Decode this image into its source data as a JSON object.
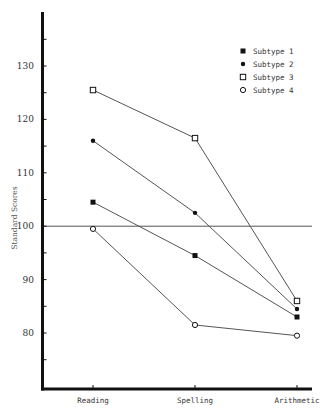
{
  "chart_data": {
    "type": "line",
    "title": "",
    "xlabel": "",
    "ylabel": "Standard Scores",
    "categories": [
      "Reading",
      "Spelling",
      "Arithmetic"
    ],
    "series": [
      {
        "name": "Subtype 1",
        "marker": "filled-square",
        "values": [
          104.5,
          94.5,
          83
        ]
      },
      {
        "name": "Subtype 2",
        "marker": "filled-circle",
        "values": [
          116,
          102.5,
          84.5
        ]
      },
      {
        "name": "Subtype 3",
        "marker": "open-square",
        "values": [
          125.5,
          116.5,
          86
        ]
      },
      {
        "name": "Subtype 4",
        "marker": "open-circle",
        "values": [
          99.5,
          81.5,
          79.5
        ]
      }
    ],
    "yticks": [
      80,
      90,
      100,
      110,
      120,
      130
    ],
    "ylim": [
      70,
      138
    ],
    "reference_line": 100,
    "grid": false,
    "legend_position": "upper right"
  },
  "colors": {
    "line": "#555555",
    "axis": "#111111",
    "text": "#333333"
  }
}
